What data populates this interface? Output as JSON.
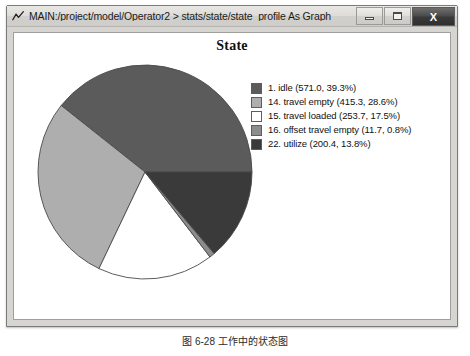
{
  "window": {
    "title": "MAIN:/project/model/Operator2 > stats/state/state_profile As Graph",
    "app_icon": "graph-icon",
    "controls": {
      "minimize_label": "",
      "maximize_label": "",
      "close_label": "X"
    }
  },
  "chart_data": {
    "type": "pie",
    "title": "State",
    "legend_position": "right",
    "start_angle_deg": 0,
    "direction": "counterclockwise",
    "categories": [
      "1. idle",
      "14. travel empty",
      "15. travel loaded",
      "16. offset travel empty",
      "22. utilize"
    ],
    "values": [
      571.0,
      415.3,
      253.7,
      11.7,
      200.4
    ],
    "percentages": [
      39.3,
      28.6,
      17.5,
      0.8,
      13.8
    ],
    "colors": [
      "#5b5b5b",
      "#aeaeae",
      "#ffffff",
      "#8c8c8c",
      "#3a3a3a"
    ],
    "legend_entries": [
      {
        "swatch": "#5b5b5b",
        "label": "1. idle (571.0, 39.3%)"
      },
      {
        "swatch": "#aeaeae",
        "label": "14. travel empty (415.3, 28.6%)"
      },
      {
        "swatch": "#ffffff",
        "label": "15. travel loaded (253.7, 17.5%)"
      },
      {
        "swatch": "#8c8c8c",
        "label": "16. offset travel empty (11.7, 0.8%)"
      },
      {
        "swatch": "#3a3a3a",
        "label": "22. utilize (200.4, 13.8%)"
      }
    ]
  },
  "caption": {
    "text": "图 6-28 工作中的状态图"
  }
}
